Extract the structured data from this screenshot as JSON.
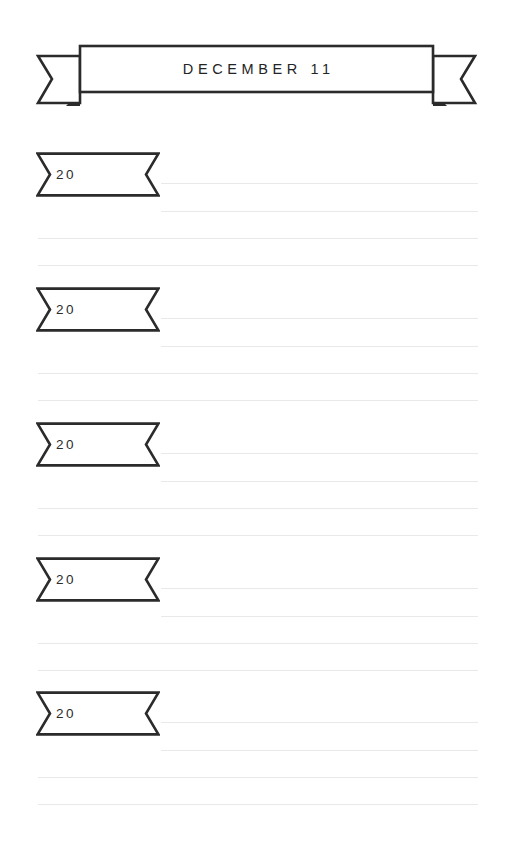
{
  "page": {
    "width": 513,
    "height": 864,
    "background": "#ffffff",
    "ink_color": "#2b2b2b",
    "rule_color": "#e9e9ea"
  },
  "header": {
    "title": "DECEMBER 11",
    "banner_icon": "ribbon-banner-icon",
    "left_tail_icon": "ribbon-tail-left-icon",
    "right_tail_icon": "ribbon-tail-right-icon"
  },
  "entries": [
    {
      "year": "20",
      "ribbon_icon": "ribbon-notched-icon",
      "top": 152,
      "rules": [
        183,
        211,
        238,
        265
      ]
    },
    {
      "year": "20",
      "ribbon_icon": "ribbon-notched-icon",
      "top": 287,
      "rules": [
        318,
        346,
        373,
        400
      ]
    },
    {
      "year": "20",
      "ribbon_icon": "ribbon-notched-icon",
      "top": 422,
      "rules": [
        453,
        481,
        508,
        535
      ]
    },
    {
      "year": "20",
      "ribbon_icon": "ribbon-notched-icon",
      "top": 557,
      "rules": [
        588,
        616,
        643,
        670
      ]
    },
    {
      "year": "20",
      "ribbon_icon": "ribbon-notched-icon",
      "top": 691,
      "rules": [
        722,
        750,
        777,
        804
      ]
    }
  ]
}
